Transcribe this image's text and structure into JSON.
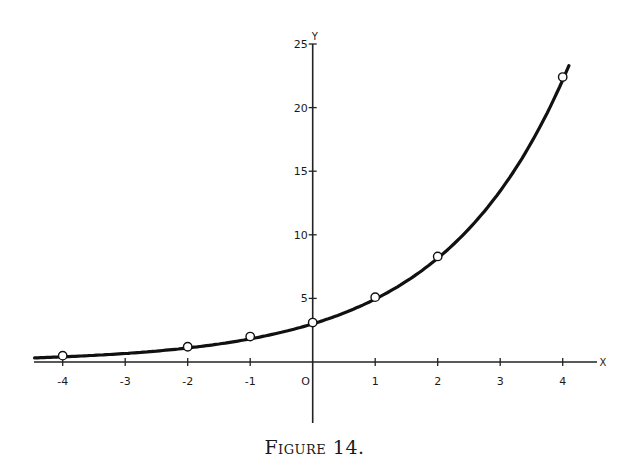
{
  "chart_data": {
    "type": "line",
    "title": "",
    "caption": "Figure 14.",
    "xlabel": "X",
    "ylabel": "Y",
    "xlim": [
      -4.45,
      4.45
    ],
    "ylim": [
      -5,
      25
    ],
    "grid": false,
    "legend": null,
    "x_ticks": [
      -4,
      -3,
      -2,
      -1,
      0,
      1,
      2,
      3,
      4
    ],
    "x_tick_labels": [
      "-4",
      "-3",
      "-2",
      "-1",
      "O",
      "1",
      "2",
      "3",
      "4"
    ],
    "y_ticks": [
      5,
      10,
      15,
      20,
      25
    ],
    "y_tick_labels": [
      "5",
      "10",
      "15",
      "20",
      "25"
    ],
    "series": [
      {
        "name": "curve",
        "style": "smooth line",
        "function_fit": "y = 3e^(x/2)",
        "x_range": [
          -4.45,
          4.1
        ]
      },
      {
        "name": "plotted points",
        "style": "open circles",
        "x": [
          -4,
          -2,
          -1,
          0,
          1,
          2,
          4
        ],
        "y": [
          0.5,
          1.2,
          2.0,
          3.1,
          5.1,
          8.3,
          22.4
        ]
      }
    ]
  },
  "axes": {
    "x_name": "X",
    "y_name": "Y",
    "origin_label": "O"
  },
  "caption": "Figure 14."
}
